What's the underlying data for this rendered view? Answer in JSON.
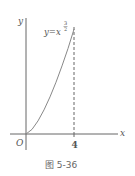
{
  "figure": {
    "caption": "图 5-36",
    "axes": {
      "x_label": "x",
      "y_label": "y",
      "origin_label": "O",
      "x_tick_label": "4"
    },
    "curve": {
      "label_base": "y=x",
      "label_exp_num": "3",
      "label_exp_den": "2",
      "function": "y = x^(3/2)",
      "domain": [
        0,
        4
      ]
    },
    "dashed_line": {
      "x": "4"
    },
    "colors": {
      "axis": "#666666",
      "curve": "#888888",
      "text": "#555555"
    }
  }
}
